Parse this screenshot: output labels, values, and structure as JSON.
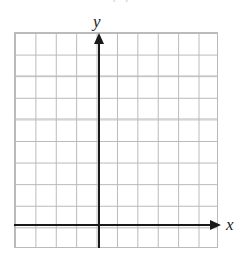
{
  "figure": {
    "kind": "blank-cartesian-coordinate-grid",
    "top_fragment_text": "( )",
    "background_color": "#ffffff"
  },
  "axes": {
    "x_label": "x",
    "y_label": "y",
    "axis_color": "#1a1a1a",
    "x_arrow_direction": "right",
    "y_arrow_direction": "up"
  },
  "grid": {
    "line_color": "#b9b9b9",
    "columns": 10,
    "rows": 10,
    "columns_left_of_y_axis": 4,
    "columns_right_of_y_axis": 6,
    "rows_above_x_axis": 9,
    "rows_below_x_axis": 1,
    "cell_width_px": 20.4,
    "cell_height_px": 21.6
  },
  "chart_data": {
    "type": "scatter",
    "title": "",
    "subtitle": "",
    "xlabel": "x",
    "ylabel": "y",
    "xlim": [
      -4,
      6
    ],
    "ylim": [
      -1,
      9
    ],
    "xticks": [
      -4,
      -3,
      -2,
      -1,
      0,
      1,
      2,
      3,
      4,
      5,
      6
    ],
    "yticks": [
      -1,
      0,
      1,
      2,
      3,
      4,
      5,
      6,
      7,
      8,
      9
    ],
    "xtick_labels": [
      "",
      "",
      "",
      "",
      "",
      "",
      "",
      "",
      "",
      "",
      ""
    ],
    "ytick_labels": [
      "",
      "",
      "",
      "",
      "",
      "",
      "",
      "",
      "",
      "",
      ""
    ],
    "grid": true,
    "legend": false,
    "legend_position": "none",
    "annotations": [],
    "series": [
      {
        "name": "",
        "x": [],
        "y": []
      }
    ],
    "note": "Empty graph paper: blank coordinate plane with no plotted data, provided for the student to draw on."
  }
}
